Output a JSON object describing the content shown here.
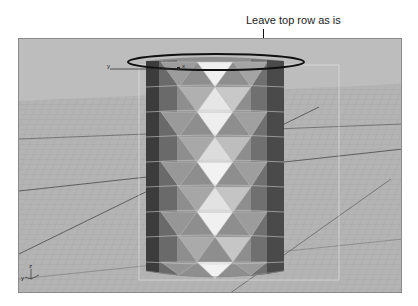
{
  "annotation": {
    "callout_text": "Leave top row as is",
    "highlight_shape": "ellipse"
  },
  "viewport": {
    "view": "perspective",
    "object": "cylinder",
    "object_style": "faceted-triangles",
    "gizmo_labels": {
      "y": "y",
      "x": "x"
    },
    "corner_axis_labels": {
      "y": "y",
      "z": "z"
    }
  },
  "colors": {
    "viewport_bg": "#bdbdbd",
    "grid_line": "#9a9a9a",
    "grid_major": "#555555",
    "callout_ellipse": "#111111"
  }
}
